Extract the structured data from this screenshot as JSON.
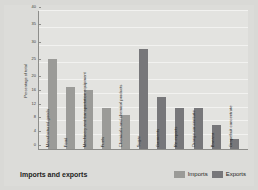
{
  "chart_data": {
    "type": "bar",
    "title": "Imports and exports",
    "xlabel": "",
    "ylabel": "Percentage of total",
    "ylim": [
      0,
      40
    ],
    "yticks": [
      0,
      4,
      8,
      12,
      16,
      20,
      25,
      30,
      35,
      40
    ],
    "grid": true,
    "legend_position": "bottom-right",
    "categories": [
      "Manufactured goods",
      "Food",
      "Machinery and transportation equipment",
      "Fuels",
      "Chemicals and chemical products",
      "Sugar",
      "Garments",
      "Re-exports",
      "Orange concentrate",
      "Banana",
      "Grapefruit concentrate"
    ],
    "values": [
      26,
      18,
      17,
      12,
      10,
      29,
      15,
      12,
      12,
      7,
      3
    ],
    "series_of_category": [
      "Imports",
      "Imports",
      "Imports",
      "Imports",
      "Imports",
      "Exports",
      "Exports",
      "Exports",
      "Exports",
      "Exports",
      "Exports"
    ],
    "series": [
      {
        "name": "Imports",
        "color": "#9b9b98"
      },
      {
        "name": "Exports",
        "color": "#77777a"
      }
    ]
  },
  "legend": {
    "imports_label": "Imports",
    "exports_label": "Exports"
  },
  "colors": {
    "background": "#dcdcd9",
    "plot_background": "#e3e3e0",
    "axis": "#8d8d8a",
    "gridline": "#f2f2f0",
    "imports": "#9b9b98",
    "exports": "#77777a"
  }
}
